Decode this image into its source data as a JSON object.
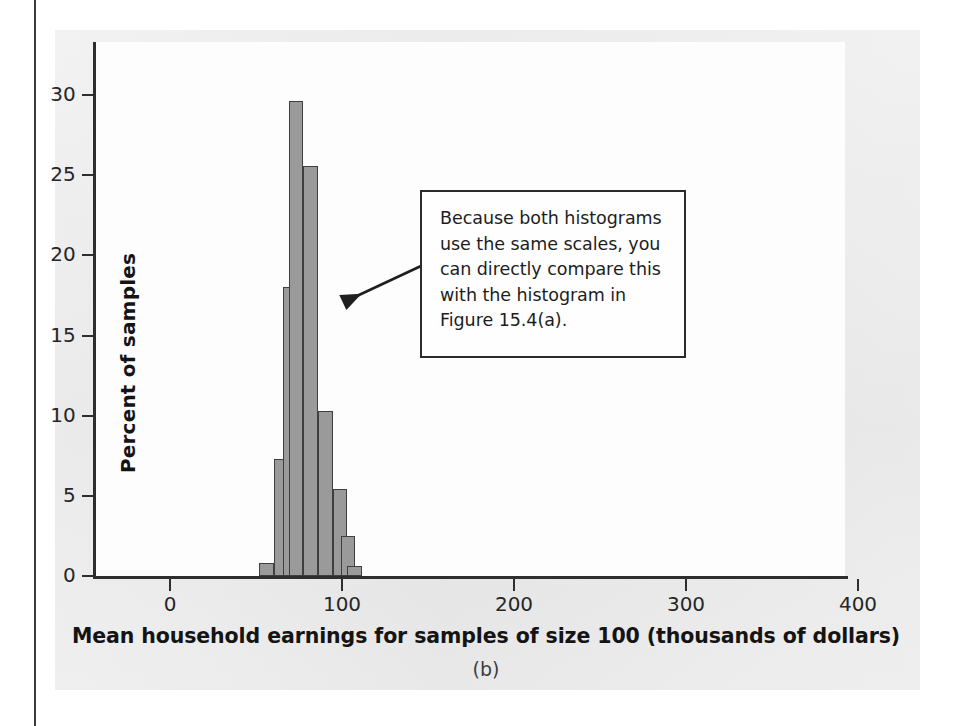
{
  "figure": {
    "panel_caption": "(b)",
    "background_color": "#e9e9e9",
    "plot_background_color": "#fdfdfd",
    "bar_fill_color": "#9a9a9a",
    "bar_edge_color": "#3f3f3f",
    "axis_color": "#2e2e2e"
  },
  "annotation": {
    "text": "Because both histograms use the same scales, you can directly compare this with the histogram in Figure 15.4(a).",
    "lines": [
      "Because both histograms",
      "use the same scales, you",
      "can directly compare this",
      "with the histogram in",
      "Figure 15.4(a)."
    ],
    "pointer": "arrow-to-histogram"
  },
  "chart_data": {
    "type": "bar",
    "title": "",
    "subtitle": "",
    "xlabel": "Mean household earnings for samples of size 100 (thousands of dollars)",
    "ylabel": "Percent of samples",
    "xlim": [
      -12,
      430
    ],
    "ylim": [
      0,
      31
    ],
    "xticks": [
      0,
      100,
      200,
      300,
      400
    ],
    "xtick_labels": [
      "0",
      "100",
      "200",
      "300",
      "400"
    ],
    "yticks": [
      0,
      5,
      10,
      15,
      20,
      25,
      30
    ],
    "ytick_labels": [
      "0",
      "5",
      "10",
      "15",
      "20",
      "25",
      "30"
    ],
    "grid": false,
    "legend": false,
    "bin_width": 8.5,
    "bin_edges": [
      52.0,
      60.5,
      69.0,
      77.5,
      86.0,
      94.5,
      103.0,
      111.5
    ],
    "bin_centers": [
      56.25,
      64.75,
      73.25,
      81.75,
      90.25,
      98.75,
      107.25
    ],
    "categories": [
      "52-60.5",
      "60.5-69",
      "69-77.5",
      "77.5-86",
      "86-94.5",
      "94.5-103",
      "103-111.5"
    ],
    "values": [
      0.8,
      7.3,
      29.6,
      25.6,
      10.3,
      5.4,
      0.6
    ],
    "bars": [
      {
        "center": 56.25,
        "left": 52.0,
        "right": 60.5,
        "percent": 0.8
      },
      {
        "center": 64.75,
        "left": 60.5,
        "right": 69.0,
        "percent": 7.3
      },
      {
        "center": 69.5,
        "left": 65.5,
        "right": 73.5,
        "percent": 18.0
      },
      {
        "center": 73.25,
        "left": 69.0,
        "right": 77.5,
        "percent": 29.6
      },
      {
        "center": 81.75,
        "left": 77.5,
        "right": 86.0,
        "percent": 25.6
      },
      {
        "center": 90.25,
        "left": 86.0,
        "right": 94.5,
        "percent": 10.3
      },
      {
        "center": 98.75,
        "left": 94.5,
        "right": 103.0,
        "percent": 5.4
      },
      {
        "center": 103.5,
        "left": 99.5,
        "right": 107.5,
        "percent": 2.5
      },
      {
        "center": 107.25,
        "left": 103.0,
        "right": 111.5,
        "percent": 0.6
      }
    ]
  }
}
